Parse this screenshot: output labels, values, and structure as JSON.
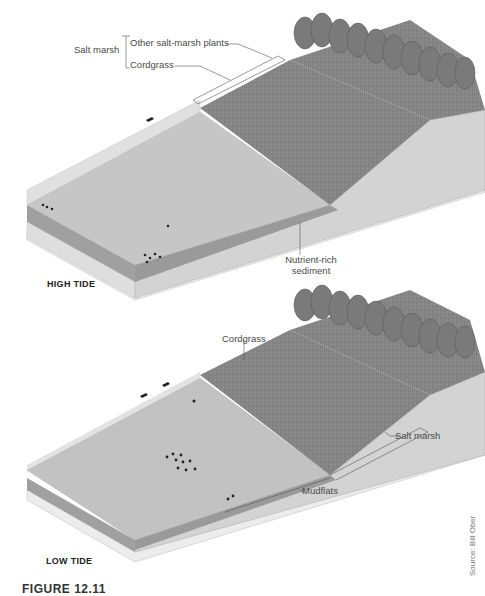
{
  "panels": {
    "high_tide": {
      "title": "HIGH TIDE",
      "labels": {
        "group": "Salt marsh",
        "other_plants": "Other salt-marsh plants",
        "cordgrass": "Cordgrass",
        "sediment_line1": "Nutrient-rich",
        "sediment_line2": "sediment"
      }
    },
    "low_tide": {
      "title": "LOW TIDE",
      "labels": {
        "cordgrass": "Cordgrass",
        "salt_marsh": "Salt marsh",
        "mudflats": "Mudflats"
      }
    }
  },
  "source": "Source: Bill Ober",
  "figure_caption": "FIGURE 12.11",
  "colors": {
    "water": "#c4c4c4",
    "water_edge": "#dadada",
    "sediment": "#9a9a9a",
    "base": "#e6e6e6",
    "side": "#d2d2d2",
    "grass": "#8a8a8a",
    "tree": "#7c7c7c"
  }
}
